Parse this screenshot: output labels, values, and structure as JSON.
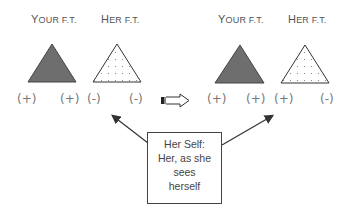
{
  "left_group": {
    "your_ft": {
      "cap": "Y",
      "rest": "OUR F.T."
    },
    "her_ft": {
      "cap": "H",
      "rest": "ER F.T."
    },
    "signs": [
      "(+)",
      "(+)",
      "(-)",
      "(-)"
    ]
  },
  "right_group": {
    "your_ft": {
      "cap": "Y",
      "rest": "OUR F.T."
    },
    "her_ft": {
      "cap": "H",
      "rest": "ER F.T."
    },
    "signs": [
      "(+)",
      "(+)",
      "(+)",
      "(-)"
    ]
  },
  "callout": {
    "lines": [
      "Her Self:",
      "Her, as she",
      "sees",
      "herself"
    ]
  },
  "colors": {
    "filled_triangle": "#6e6e6e",
    "outline": "#333333"
  }
}
